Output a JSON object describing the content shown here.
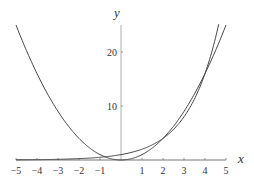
{
  "chart_data": {
    "type": "line",
    "title": "",
    "xlabel": "x",
    "ylabel": "y",
    "xlim": [
      -5,
      5
    ],
    "ylim": [
      0,
      25
    ],
    "xticks": [
      -5,
      -4,
      -3,
      -2,
      -1,
      1,
      2,
      3,
      4,
      5
    ],
    "yticks": [
      10,
      20
    ],
    "grid": false,
    "series": [
      {
        "name": "y = x^2",
        "x": [
          -5,
          -4,
          -3,
          -2,
          -1,
          0,
          1,
          2,
          3,
          4,
          5
        ],
        "values": [
          25,
          16,
          9,
          4,
          1,
          0,
          1,
          4,
          9,
          16,
          25
        ]
      },
      {
        "name": "y = 2^x",
        "x": [
          -5,
          -4,
          -3,
          -2,
          -1,
          0,
          1,
          2,
          3,
          4,
          4.64
        ],
        "values": [
          0.03,
          0.06,
          0.13,
          0.25,
          0.5,
          1,
          2,
          4,
          8,
          16,
          25
        ]
      }
    ]
  },
  "labels": {
    "x_axis": "x",
    "y_axis": "y",
    "xtick_labels": [
      "−5",
      "−4",
      "−3",
      "−2",
      "−1",
      "1",
      "2",
      "3",
      "4",
      "5"
    ],
    "ytick_labels": [
      "10",
      "20"
    ]
  }
}
